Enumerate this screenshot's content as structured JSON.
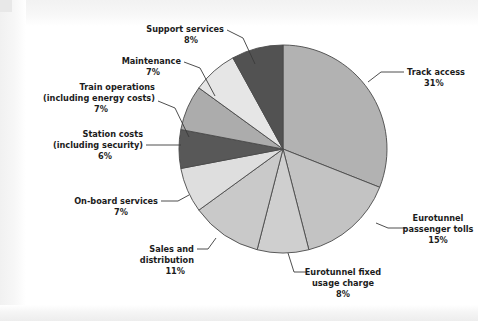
{
  "figure": {
    "background_color": "#ffffff",
    "outline_color": "#4a4a4a"
  },
  "chart_data": {
    "type": "pie",
    "title": "",
    "subtitle": "",
    "xlabel": "",
    "ylabel": "",
    "grid": false,
    "legend_position": "none",
    "label_format": "name + percent",
    "start_angle_deg": 0,
    "direction": "clockwise",
    "center": {
      "x": 283,
      "y": 149
    },
    "radius": 104,
    "categories": [
      "Track access",
      "Eurotunnel passenger tolls",
      "Eurotunnel fixed usage charge",
      "Sales and distribution",
      "On-board services",
      "Station costs (including security)",
      "Train operations (including energy costs)",
      "Maintenance",
      "Support services"
    ],
    "values": [
      31,
      15,
      8,
      11,
      7,
      6,
      7,
      7,
      8
    ],
    "value_unit": "%",
    "colors": [
      "#b2b2b2",
      "#c3c3c3",
      "#cfcfcf",
      "#c9c9c9",
      "#dedede",
      "#585858",
      "#acacac",
      "#e6e6e6",
      "#525252"
    ],
    "slices": [
      {
        "name": "Track access",
        "value": 31,
        "percent_text": "31%",
        "color": "#b2b2b2",
        "label_lines": [
          "Track access",
          "31%"
        ]
      },
      {
        "name": "Eurotunnel passenger tolls",
        "value": 15,
        "percent_text": "15%",
        "color": "#c3c3c3",
        "label_lines": [
          "Eurotunnel",
          "passenger tolls",
          "15%"
        ]
      },
      {
        "name": "Eurotunnel fixed usage charge",
        "value": 8,
        "percent_text": "8%",
        "color": "#cfcfcf",
        "label_lines": [
          "Eurotunnel fixed",
          "usage charge",
          "8%"
        ]
      },
      {
        "name": "Sales and distribution",
        "value": 11,
        "percent_text": "11%",
        "color": "#c9c9c9",
        "label_lines": [
          "Sales and",
          "distribution",
          "11%"
        ]
      },
      {
        "name": "On-board services",
        "value": 7,
        "percent_text": "7%",
        "color": "#dedede",
        "label_lines": [
          "On-board services",
          "7%"
        ]
      },
      {
        "name": "Station costs (including security)",
        "value": 6,
        "percent_text": "6%",
        "color": "#585858",
        "label_lines": [
          "Station costs",
          "(including security)",
          "6%"
        ]
      },
      {
        "name": "Train operations (including energy costs)",
        "value": 7,
        "percent_text": "7%",
        "color": "#acacac",
        "label_lines": [
          "Train operations",
          "(including energy costs)",
          "7%"
        ]
      },
      {
        "name": "Maintenance",
        "value": 7,
        "percent_text": "7%",
        "color": "#e6e6e6",
        "label_lines": [
          "Maintenance",
          "7%"
        ]
      },
      {
        "name": "Support services",
        "value": 8,
        "percent_text": "8%",
        "color": "#525252",
        "label_lines": [
          "Support services",
          "8%"
        ]
      }
    ]
  },
  "labels": {
    "track_access": {
      "line1": "Track access",
      "line2": "31%"
    },
    "eurotunnel_passenger_tolls": {
      "line1": "Eurotunnel",
      "line2": "passenger tolls",
      "line3": "15%"
    },
    "eurotunnel_fixed_usage_charge": {
      "line1": "Eurotunnel fixed",
      "line2": "usage charge",
      "line3": "8%"
    },
    "sales_and_distribution": {
      "line1": "Sales and",
      "line2": "distribution",
      "line3": "11%"
    },
    "on_board_services": {
      "line1": "On-board services",
      "line2": "7%"
    },
    "station_costs": {
      "line1": "Station costs",
      "line2": "(including security)",
      "line3": "6%"
    },
    "train_operations": {
      "line1": "Train operations",
      "line2": "(including energy costs)",
      "line3": "7%"
    },
    "maintenance": {
      "line1": "Maintenance",
      "line2": "7%"
    },
    "support_services": {
      "line1": "Support services",
      "line2": "8%"
    }
  }
}
